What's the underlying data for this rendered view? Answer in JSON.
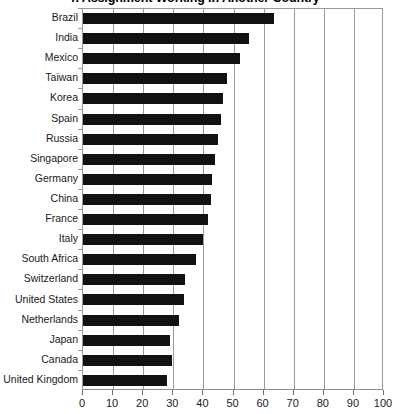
{
  "chart_data": {
    "type": "bar",
    "orientation": "horizontal",
    "title": "n Assignment Working in Another Country",
    "xlabel": "",
    "ylabel": "",
    "xlim": [
      0,
      100
    ],
    "xticks": [
      0,
      10,
      20,
      30,
      40,
      50,
      60,
      70,
      80,
      90,
      100
    ],
    "grid": true,
    "grid_axis": "x",
    "legend": false,
    "bar_color": "#111111",
    "categories": [
      "Brazil",
      "India",
      "Mexico",
      "Taiwan",
      "Korea",
      "Spain",
      "Russia",
      "Singapore",
      "Germany",
      "China",
      "France",
      "Italy",
      "South Africa",
      "Switzerland",
      "United States",
      "Netherlands",
      "Japan",
      "Canada",
      "United Kingdom"
    ],
    "values": [
      63.5,
      55,
      52,
      48,
      46.5,
      46,
      45,
      44,
      43,
      42.5,
      41.5,
      40,
      37.5,
      34,
      33.5,
      32,
      29,
      29.5,
      28
    ]
  }
}
